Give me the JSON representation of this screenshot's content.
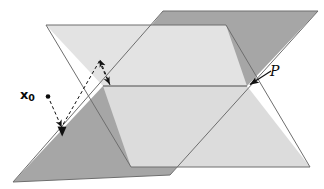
{
  "figure": {
    "type": "geometry-diagram",
    "background_color": "#ffffff",
    "labels": {
      "point_label_base": "x",
      "point_label_subscript": "0",
      "plane_label": "P"
    },
    "colors": {
      "plane_light": "#e3e3e3",
      "plane_light_alt": "#dcdcdc",
      "plane_dark": "#a6a6a6",
      "plane_dark_alt": "#9e9e9e",
      "outline": "#6b6b6b",
      "annotation": "#111111",
      "background": "#ffffff"
    },
    "geometry": {
      "light_plane_quad": "46,25 226,25 310,167 131,167",
      "dark_plane_quad": "163,11 318,11 170,175 13,182",
      "intersection_point": [
        247,
        86
      ],
      "left_vertex": [
        103,
        86
      ],
      "horizontal_edge": "103,86 247,86"
    },
    "annotations": {
      "point_marker": [
        48,
        97
      ],
      "arrow_from_x0_to_plane": "50,100 62,131",
      "arrow_up_vector": "110,85 99,59",
      "arrow_down_vector": "99,60 110,84",
      "arrow_long_dashed": "99,60 62,131",
      "plane_pointer_arrow": "270,72 249,85"
    }
  }
}
